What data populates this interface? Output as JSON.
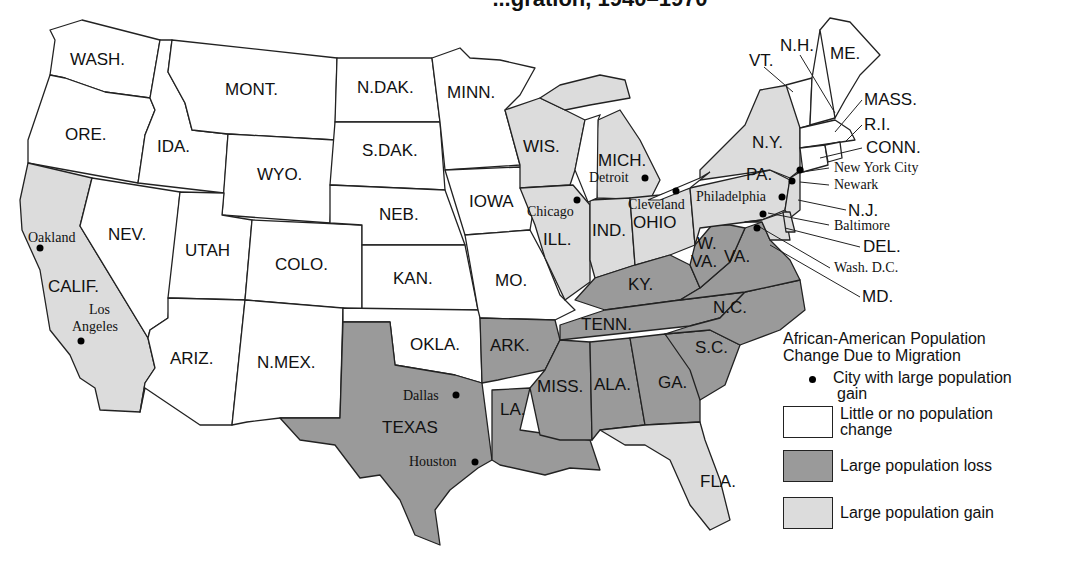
{
  "title": "...gration, 1940–1970",
  "colors": {
    "none": "#ffffff",
    "loss": "#9a9a9a",
    "gain": "#dcdcdc",
    "outline": "#222222"
  },
  "legend": {
    "title_line1": "African-American Population",
    "title_line2": "Change Due to Migration",
    "items": [
      {
        "symbol": "dot",
        "label_line1": "City with large population",
        "label_line2": "gain"
      },
      {
        "symbol": "none",
        "label_line1": "Little or no population",
        "label_line2": "change"
      },
      {
        "symbol": "loss",
        "label_line1": "Large population loss",
        "label_line2": ""
      },
      {
        "symbol": "gain",
        "label_line1": "Large population gain",
        "label_line2": ""
      }
    ]
  },
  "states": {
    "wash": {
      "label": "WASH.",
      "category": "none"
    },
    "ore": {
      "label": "ORE.",
      "category": "none"
    },
    "calif": {
      "label": "CALIF.",
      "category": "gain"
    },
    "ida": {
      "label": "IDA.",
      "category": "none"
    },
    "nev": {
      "label": "NEV.",
      "category": "none"
    },
    "mont": {
      "label": "MONT.",
      "category": "none"
    },
    "wyo": {
      "label": "WYO.",
      "category": "none"
    },
    "utah": {
      "label": "UTAH",
      "category": "none"
    },
    "ariz": {
      "label": "ARIZ.",
      "category": "none"
    },
    "colo": {
      "label": "COLO.",
      "category": "none"
    },
    "nmex": {
      "label": "N.MEX.",
      "category": "none"
    },
    "ndak": {
      "label": "N.DAK.",
      "category": "none"
    },
    "sdak": {
      "label": "S.DAK.",
      "category": "none"
    },
    "neb": {
      "label": "NEB.",
      "category": "none"
    },
    "kan": {
      "label": "KAN.",
      "category": "none"
    },
    "okla": {
      "label": "OKLA.",
      "category": "none"
    },
    "texas": {
      "label": "TEXAS",
      "category": "loss"
    },
    "minn": {
      "label": "MINN.",
      "category": "none"
    },
    "iowa": {
      "label": "IOWA",
      "category": "none"
    },
    "mo": {
      "label": "MO.",
      "category": "none"
    },
    "ark": {
      "label": "ARK.",
      "category": "loss"
    },
    "la": {
      "label": "LA.",
      "category": "loss"
    },
    "wis": {
      "label": "WIS.",
      "category": "gain"
    },
    "ill": {
      "label": "ILL.",
      "category": "gain"
    },
    "mich": {
      "label": "MICH.",
      "category": "gain"
    },
    "ind": {
      "label": "IND.",
      "category": "gain"
    },
    "ohio": {
      "label": "OHIO",
      "category": "gain"
    },
    "ky": {
      "label": "KY.",
      "category": "loss"
    },
    "tenn": {
      "label": "TENN.",
      "category": "loss"
    },
    "miss": {
      "label": "MISS.",
      "category": "loss"
    },
    "ala": {
      "label": "ALA.",
      "category": "loss"
    },
    "ga": {
      "label": "GA.",
      "category": "loss"
    },
    "fla": {
      "label": "FLA.",
      "category": "gain"
    },
    "sc": {
      "label": "S.C.",
      "category": "loss"
    },
    "nc": {
      "label": "N.C.",
      "category": "loss"
    },
    "va": {
      "label": "VA.",
      "category": "loss"
    },
    "wva_1": {
      "label": "W.",
      "category": "loss"
    },
    "wva_2": {
      "label": "VA.",
      "category": "loss"
    },
    "pa": {
      "label": "PA.",
      "category": "gain"
    },
    "ny": {
      "label": "N.Y.",
      "category": "gain"
    },
    "nj": {
      "label": "N.J.",
      "category": "gain"
    },
    "del": {
      "label": "DEL.",
      "category": "gain"
    },
    "md": {
      "label": "MD.",
      "category": "gain"
    },
    "vt": {
      "label": "VT.",
      "category": "none"
    },
    "nh": {
      "label": "N.H.",
      "category": "none"
    },
    "me": {
      "label": "ME.",
      "category": "none"
    },
    "mass": {
      "label": "MASS.",
      "category": "none"
    },
    "ri": {
      "label": "R.I.",
      "category": "none"
    },
    "conn": {
      "label": "CONN.",
      "category": "none"
    }
  },
  "cities": {
    "oakland": "Oakland",
    "los_angeles_1": "Los",
    "los_angeles_2": "Angeles",
    "dallas": "Dallas",
    "houston": "Houston",
    "chicago": "Chicago",
    "detroit": "Detroit",
    "cleveland": "Cleveland",
    "philadelphia": "Philadelphia",
    "new_york_city": "New York City",
    "newark": "Newark",
    "baltimore": "Baltimore",
    "wash_dc": "Wash. D.C."
  }
}
